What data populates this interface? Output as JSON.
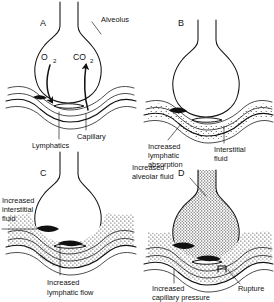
{
  "figure": {
    "background_color": "#ffffff",
    "ink_color": "#111111",
    "panel_count": 4
  },
  "panels": [
    {
      "id": "A",
      "letter": "A",
      "caption": "Normal alveolus with gas exchange",
      "alveolus_fill": "clear",
      "interstitium_fill": "clear",
      "labels": [
        {
          "name": "alveolus",
          "text": "Alveolus"
        },
        {
          "name": "capillary",
          "text": "Capillary"
        },
        {
          "name": "lymphatics",
          "text": "Lymphatics"
        }
      ],
      "gases": [
        {
          "name": "oxygen",
          "text": "O",
          "subscript": "2",
          "direction": "into-capillary"
        },
        {
          "name": "carbon-dioxide",
          "text": "CO",
          "subscript": "2",
          "direction": "into-alveolus"
        }
      ]
    },
    {
      "id": "B",
      "letter": "B",
      "caption": "Interstitial fluid with increased lymphatic absorption",
      "alveolus_fill": "clear",
      "interstitium_fill": "stippled",
      "labels": [
        {
          "name": "increased-lymphatic-absorption",
          "text": "Increased lymphatic absorption"
        },
        {
          "name": "interstitial-fluid",
          "text": "Interstitial fluid"
        }
      ],
      "gases": []
    },
    {
      "id": "C",
      "letter": "C",
      "caption": "Increased interstitial fluid with increased lymphatic flow",
      "alveolus_fill": "clear",
      "interstitium_fill": "heavily-stippled",
      "labels": [
        {
          "name": "increased-interstitial-fluid",
          "text": "Increased interstitial fluid"
        },
        {
          "name": "increased-lymphatic-flow",
          "text": "Increased lymphatic flow"
        }
      ],
      "gases": []
    },
    {
      "id": "D",
      "letter": "D",
      "caption": "Alveolar flooding from capillary rupture",
      "alveolus_fill": "stippled",
      "interstitium_fill": "stippled",
      "labels": [
        {
          "name": "increased-alveolar-fluid",
          "text": "Increased alveolar fluid"
        },
        {
          "name": "increased-capillary-pressure",
          "text": "Increased capillary pressure"
        },
        {
          "name": "rupture",
          "text": "Rupture"
        }
      ],
      "gases": []
    }
  ],
  "label_lines": {
    "panel_a": {
      "alveolus": "Alveolus",
      "capillary": "Capillary",
      "lymphatics": "Lymphatics",
      "o2_main": "O",
      "o2_sub": "2",
      "co2_main": "CO",
      "co2_sub": "2"
    },
    "panel_b": {
      "lymph_line1": "Increased",
      "lymph_line2": "lymphatic",
      "lymph_line3": "absorption",
      "interstitial_line1": "Interstitial",
      "interstitial_line2": "fluid"
    },
    "panel_c": {
      "interstitial_line1": "Increased",
      "interstitial_line2": "interstitial",
      "interstitial_line3": "fluid",
      "flow_line1": "Increased",
      "flow_line2": "lymphatic flow"
    },
    "panel_d": {
      "alveolar_line1": "Increased",
      "alveolar_line2": "alveolar fluid",
      "pressure_line1": "Increased",
      "pressure_line2": "capillary pressure",
      "rupture": "Rupture"
    }
  },
  "panel_letters": {
    "a": "A",
    "b": "B",
    "c": "C",
    "d": "D"
  }
}
